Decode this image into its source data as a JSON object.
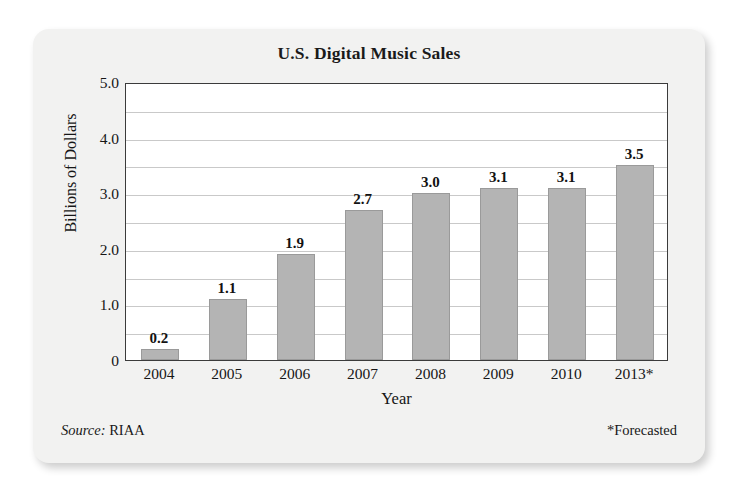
{
  "chart_data": {
    "type": "bar",
    "title": "U.S. Digital Music Sales",
    "xlabel": "Year",
    "ylabel": "Billions of Dollars",
    "categories": [
      "2004",
      "2005",
      "2006",
      "2007",
      "2008",
      "2009",
      "2010",
      "2013*"
    ],
    "values": [
      0.2,
      1.1,
      1.9,
      2.7,
      3.0,
      3.1,
      3.1,
      3.5
    ],
    "value_labels": [
      "0.2",
      "1.1",
      "1.9",
      "2.7",
      "3.0",
      "3.1",
      "3.1",
      "3.5"
    ],
    "ylim": [
      0,
      5.0
    ],
    "y_ticks": [
      0,
      1.0,
      2.0,
      3.0,
      4.0,
      5.0
    ],
    "y_tick_labels": [
      "0",
      "1.0",
      "2.0",
      "3.0",
      "4.0",
      "5.0"
    ],
    "gridline_step": 0.5,
    "grid": true,
    "legend": "none",
    "bar_color": "#b4b4b4",
    "bar_border_color": "#9a9a9a",
    "axis_color": "#3b3b3b",
    "gridline_color": "#c9c9c9",
    "card_background": "#f2f2f1",
    "plot_background": "#ffffff"
  },
  "footer": {
    "source_word": "Source:",
    "source_value": " RIAA",
    "note": "*Forecasted"
  }
}
